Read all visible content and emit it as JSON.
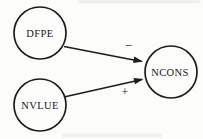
{
  "diagram": {
    "type": "causal-path-diagram",
    "nodes": {
      "dfpe": {
        "label": "DFPE"
      },
      "nvlue": {
        "label": "NVLUE"
      },
      "ncons": {
        "label": "NCONS"
      }
    },
    "edges": {
      "dfpe_ncons": {
        "from": "DFPE",
        "to": "NCONS",
        "sign": "−"
      },
      "nvlue_ncons": {
        "from": "NVLUE",
        "to": "NCONS",
        "sign": "+"
      }
    },
    "colors": {
      "ink": "#1c1c1c",
      "background": "#fcfcfb"
    }
  }
}
